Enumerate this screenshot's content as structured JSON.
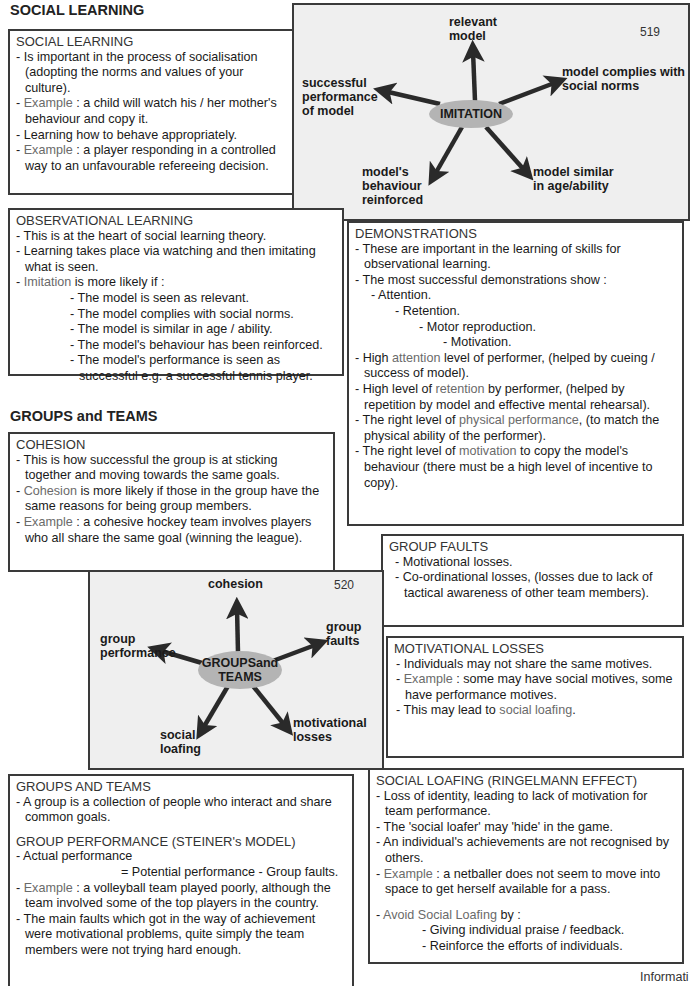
{
  "headings": {
    "social_learning": "SOCIAL LEARNING",
    "groups_teams": "GROUPS and TEAMS"
  },
  "social_learning_box": {
    "title": "SOCIAL LEARNING",
    "items": [
      {
        "prefix": "- ",
        "text": "Is important in the process of socialisation (adopting the norms and values of your culture)."
      },
      {
        "prefix": "- ",
        "grey": "Example",
        "text": " : a child will watch his / her mother's behaviour and copy it."
      },
      {
        "prefix": "- ",
        "text": "Learning how to behave appropriately."
      },
      {
        "prefix": "- ",
        "grey": "Example",
        "text": " : a player responding in a controlled way to an unfavourable refereeing decision."
      }
    ]
  },
  "imitation_diagram": {
    "page_number": "519",
    "center": "IMITATION",
    "labels": {
      "top": "relevant model",
      "right": "model complies with social norms",
      "left": "successful performance of model",
      "bottom_left": "model's behaviour reinforced",
      "bottom_right": "model similar in age/ability"
    }
  },
  "observational_box": {
    "title": "OBSERVATIONAL LEARNING",
    "items": [
      "- This is at the heart of social learning theory.",
      "- Learning takes place via watching and then imitating what is seen."
    ],
    "imitation_intro_grey": "Imitation",
    "imitation_intro_rest": " is more likely if :",
    "sub_items": [
      "- The model is seen as relevant.",
      "- The model complies with social norms.",
      "- The model is similar in age / ability.",
      "- The model's behaviour has been reinforced.",
      "- The model's performance is seen as successful e.g. a successful tennis player."
    ]
  },
  "demonstrations_box": {
    "title": "DEMONSTRATIONS",
    "items": [
      "- These are important in the learning of skills for observational learning.",
      "- The most successful demonstrations show :"
    ],
    "steps": [
      "- Attention.",
      "- Retention.",
      "- Motor reproduction.",
      "- Motivation."
    ],
    "points": [
      {
        "pre": "- High ",
        "grey": "attention",
        "post": " level of performer, (helped by cueing / success of model)."
      },
      {
        "pre": "- High level of ",
        "grey": "retention",
        "post": " by performer, (helped by repetition by model and effective mental rehearsal)."
      },
      {
        "pre": "- The right level of ",
        "grey": "physical performance",
        "post": ", (to match the physical ability of the performer)."
      },
      {
        "pre": "- The right level of ",
        "grey": "motivation",
        "post": " to copy the model's behaviour (there must be a high level of incentive to copy)."
      }
    ]
  },
  "cohesion_box": {
    "title": "COHESION",
    "items": [
      {
        "pre": "- This is how successful the group is at sticking together and moving towards the same goals.",
        "grey": "",
        "post": ""
      },
      {
        "pre": "- ",
        "grey": "Cohesion",
        "post": " is more likely if those in the group have the same reasons for being group members."
      },
      {
        "pre": "- ",
        "grey": "Example",
        "post": " : a cohesive hockey team involves players who all share the same goal (winning the league)."
      }
    ]
  },
  "group_faults_box": {
    "title": "GROUP FAULTS",
    "items": [
      "- Motivational losses.",
      "- Co-ordinational losses, (losses due to lack of tactical awareness of other team members)."
    ]
  },
  "groups_diagram": {
    "page_number": "520",
    "center_line1": "GROUPSand",
    "center_line2": "TEAMS",
    "labels": {
      "top": "cohesion",
      "right": "group faults",
      "left": "group performance",
      "bottom_left": "social loafing",
      "bottom_right": "motivational losses"
    }
  },
  "motivational_losses_box": {
    "title": "MOTIVATIONAL LOSSES",
    "items": [
      {
        "pre": "- Individuals may not share the same motives.",
        "grey": "",
        "post": ""
      },
      {
        "pre": "- ",
        "grey": "Example",
        "post": " : some may have social motives, some have performance motives."
      },
      {
        "pre": "- This may lead to ",
        "grey": "social loafing",
        "post": "."
      }
    ]
  },
  "groups_teams_box": {
    "title": "GROUPS AND TEAMS",
    "intro": "- A group is a collection of people who interact and share common goals.",
    "subtitle": "GROUP PERFORMANCE (STEINER's MODEL)",
    "formula_line1": "- Actual performance",
    "formula_line2": "= Potential performance - Group faults.",
    "items": [
      {
        "pre": "- ",
        "grey": "Example",
        "post": " : a volleyball team played poorly, although the team involved some of the top players in the country."
      },
      {
        "pre": "- The main faults which got in the way of achievement were motivational problems, quite simply the team members were not trying hard enough.",
        "grey": "",
        "post": ""
      }
    ]
  },
  "social_loafing_box": {
    "title": "SOCIAL LOAFING (RINGELMANN EFFECT)",
    "items": [
      {
        "pre": "- Loss of identity, leading to lack of motivation for team performance.",
        "grey": "",
        "post": ""
      },
      {
        "pre": "- The 'social loafer' may 'hide' in the game.",
        "grey": "",
        "post": ""
      },
      {
        "pre": "- An individual's achievements are not recognised by others.",
        "grey": "",
        "post": ""
      },
      {
        "pre": "- ",
        "grey": "Example",
        "post": " : a netballer does not seem to move into space to get herself available for a pass."
      }
    ],
    "avoid_grey": "Avoid Social Loafing",
    "avoid_rest": " by :",
    "avoid_items": [
      "- Giving individual praise / feedback.",
      "- Reinforce the efforts of individuals."
    ]
  },
  "footer": {
    "text": "Informati"
  }
}
